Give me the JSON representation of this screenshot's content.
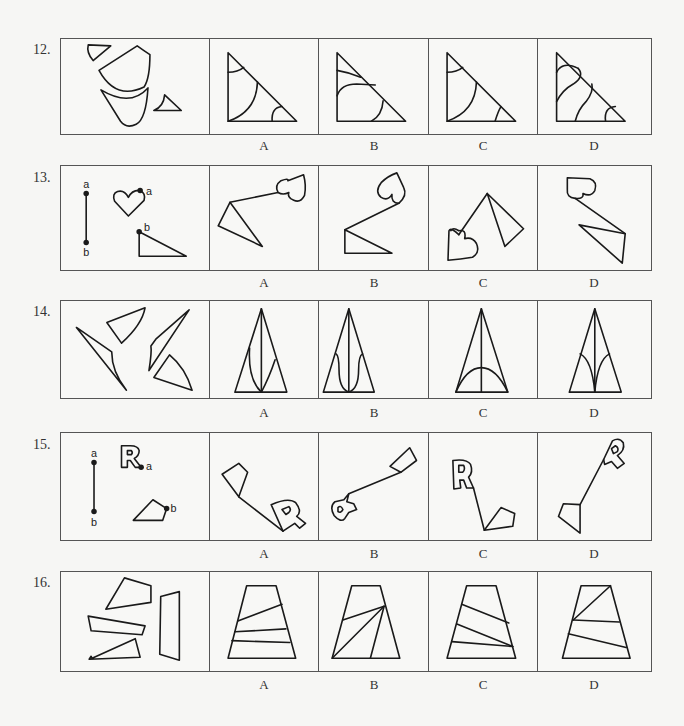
{
  "questions": [
    {
      "number": "12.",
      "options": [
        "A",
        "B",
        "C",
        "D"
      ],
      "stem_shapes": "four curved-edge fragments (small triangle, fan/sector, curved cup shape, small triangle with concave side)",
      "option_shapes": "right triangles divided by curved lines"
    },
    {
      "number": "13.",
      "options": [
        "A",
        "B",
        "C",
        "D"
      ],
      "stem_labels": {
        "segment_top": "a",
        "segment_bottom": "b",
        "heart_point": "a",
        "triangle_point": "b"
      },
      "option_shapes": "heart and right triangle connected by a line a-b"
    },
    {
      "number": "14.",
      "options": [
        "A",
        "B",
        "C",
        "D"
      ],
      "stem_shapes": "four pieces: two slender curved triangles and two sector-like quadrilaterals",
      "option_shapes": "tall isosceles triangles with a center line and curved divisions"
    },
    {
      "number": "15.",
      "options": [
        "A",
        "B",
        "C",
        "D"
      ],
      "stem_labels": {
        "segment_top": "a",
        "segment_bottom": "b",
        "letter_point": "a",
        "pentagon_point": "b"
      },
      "stem_letter": "R",
      "option_shapes": "outlined letter R and quadrilateral connected by a line a-b"
    },
    {
      "number": "16.",
      "options": [
        "A",
        "B",
        "C",
        "D"
      ],
      "stem_shapes": "four quadrilateral pieces",
      "option_shapes": "trapezoids divided by straight lines"
    }
  ]
}
